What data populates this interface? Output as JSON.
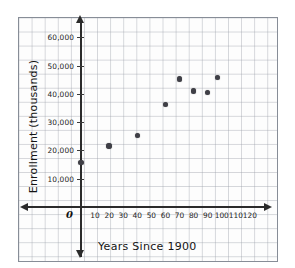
{
  "chart_data": {
    "type": "scatter",
    "title": "",
    "xlabel": "Years Since 1900",
    "ylabel": "Enrollment (thousands)",
    "xlim": [
      0,
      125
    ],
    "ylim": [
      0,
      62000
    ],
    "grid": true,
    "legend": "none",
    "origin_label": "0",
    "xticks": [
      10,
      20,
      30,
      40,
      50,
      60,
      70,
      80,
      90,
      100,
      110,
      120
    ],
    "xtick_labels": [
      "10",
      "20",
      "30",
      "40",
      "50",
      "60",
      "70",
      "80",
      "90",
      "100",
      "110",
      "120"
    ],
    "yticks": [
      10000,
      20000,
      30000,
      40000,
      50000,
      60000
    ],
    "ytick_labels": [
      "10,000",
      "20,000",
      "30,000",
      "40,000",
      "50,000",
      "60,000"
    ],
    "x": [
      0,
      20,
      40,
      60,
      70,
      80,
      90,
      97
    ],
    "y": [
      15700,
      21600,
      25300,
      36300,
      45200,
      41000,
      40500,
      45800
    ],
    "points": [
      {
        "x": 0,
        "y": 15700
      },
      {
        "x": 20,
        "y": 21600
      },
      {
        "x": 40,
        "y": 25300
      },
      {
        "x": 60,
        "y": 36300
      },
      {
        "x": 70,
        "y": 45200
      },
      {
        "x": 80,
        "y": 41000
      },
      {
        "x": 90,
        "y": 40500
      },
      {
        "x": 97,
        "y": 45800
      }
    ],
    "marker": "filled-circle",
    "marker_color": "#3f3f46",
    "grid_color": "#969ba5",
    "axis_color": "#2b2b2b",
    "background": "#fdfdfd"
  }
}
